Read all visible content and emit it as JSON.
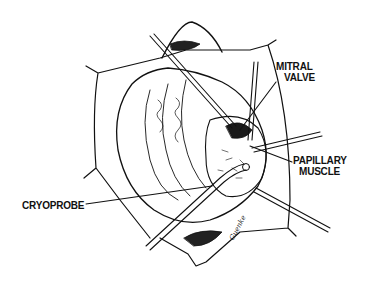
{
  "figure": {
    "type": "surgical line illustration",
    "labels": {
      "mitral_valve": [
        "MITRAL",
        "VALVE"
      ],
      "papillary_muscle": [
        "PAPILLARY",
        "MUSCLE"
      ],
      "cryoprobe": "CRYOPROBE"
    },
    "signature": "Guenke",
    "colors": {
      "ink": "#111111",
      "background": "#ffffff"
    }
  }
}
